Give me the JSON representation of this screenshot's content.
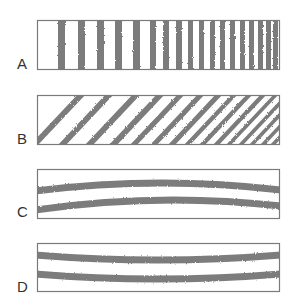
{
  "figure": {
    "colors": {
      "stripe": "#6e6e6e",
      "frame": "#7a7a7a",
      "background": "#ffffff",
      "label": "#333333"
    },
    "panels": [
      {
        "label": "A",
        "pattern": "vertical-stripes",
        "box": {
          "x": 37,
          "y": 20,
          "w": 242,
          "h": 49
        },
        "label_y": 57,
        "stripes": [
          [
            58,
            7
          ],
          [
            78,
            7
          ],
          [
            97,
            7
          ],
          [
            115,
            7
          ],
          [
            133,
            7
          ],
          [
            150,
            6
          ],
          [
            163,
            6
          ],
          [
            176,
            6
          ],
          [
            188,
            5
          ],
          [
            199,
            5
          ],
          [
            210,
            5
          ],
          [
            220,
            5
          ],
          [
            230,
            5
          ],
          [
            240,
            5
          ],
          [
            249,
            5
          ],
          [
            258,
            5
          ],
          [
            266,
            5
          ],
          [
            273,
            5
          ]
        ]
      },
      {
        "label": "B",
        "pattern": "diagonal-stripes",
        "box": {
          "x": 37,
          "y": 95,
          "w": 242,
          "h": 49
        },
        "label_y": 132,
        "slant": 46,
        "stripes": [
          [
            -8,
            8
          ],
          [
            20,
            8
          ],
          [
            47,
            8
          ],
          [
            71,
            8
          ],
          [
            92,
            7
          ],
          [
            112,
            7
          ],
          [
            130,
            7
          ],
          [
            146,
            6
          ],
          [
            161,
            6
          ],
          [
            175,
            6
          ],
          [
            188,
            5
          ],
          [
            200,
            5
          ],
          [
            211,
            5
          ],
          [
            222,
            5
          ],
          [
            232,
            5
          ],
          [
            242,
            5
          ],
          [
            252,
            5
          ],
          [
            262,
            5
          ]
        ]
      },
      {
        "label": "C",
        "pattern": "curved-bands-arch",
        "box": {
          "x": 37,
          "y": 169,
          "w": 242,
          "h": 49
        },
        "label_y": 205,
        "bands": [
          {
            "left": 191,
            "mid": 183,
            "right": 190,
            "thickness": 7
          },
          {
            "left": 210,
            "mid": 200,
            "right": 206,
            "thickness": 7
          }
        ]
      },
      {
        "label": "D",
        "pattern": "curved-bands-sag",
        "box": {
          "x": 37,
          "y": 243,
          "w": 242,
          "h": 48
        },
        "label_y": 280,
        "bands": [
          {
            "left": 255,
            "mid": 260,
            "right": 255,
            "thickness": 7
          },
          {
            "left": 274,
            "mid": 279,
            "right": 274,
            "thickness": 7
          }
        ]
      }
    ]
  }
}
